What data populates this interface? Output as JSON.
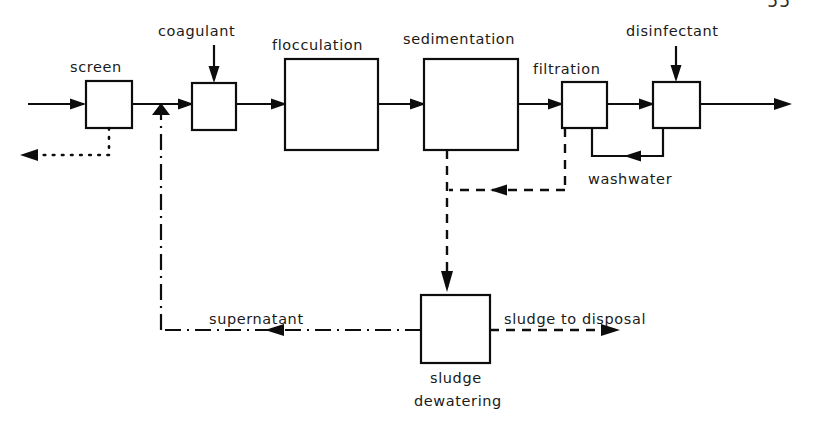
{
  "page": {
    "page_number": "55",
    "width": 813,
    "height": 428
  },
  "diagram": {
    "type": "process-flow-diagram",
    "units": [
      {
        "id": "screen",
        "label": "screen",
        "x": 86,
        "y": 81,
        "w": 46,
        "h": 47
      },
      {
        "id": "coagulant_mixer",
        "label": "",
        "x": 192,
        "y": 83,
        "w": 44,
        "h": 47
      },
      {
        "id": "flocculation",
        "label": "flocculation",
        "x": 285,
        "y": 59,
        "w": 93,
        "h": 91
      },
      {
        "id": "sedimentation",
        "label": "sedimentation",
        "x": 424,
        "y": 59,
        "w": 94,
        "h": 91
      },
      {
        "id": "filtration",
        "label": "filtration",
        "x": 562,
        "y": 82,
        "w": 45,
        "h": 46
      },
      {
        "id": "disinfection",
        "label": "",
        "x": 653,
        "y": 82,
        "w": 47,
        "h": 46
      },
      {
        "id": "sludge_dewatering",
        "label": "sludge dewatering",
        "x": 421,
        "y": 295,
        "w": 69,
        "h": 68
      }
    ],
    "labels": [
      {
        "id": "label-screen",
        "text": "screen",
        "x": 70,
        "y": 72,
        "anchor": "start"
      },
      {
        "id": "label-coagulant",
        "text": "coagulant",
        "x": 158,
        "y": 36,
        "anchor": "start"
      },
      {
        "id": "label-flocculation",
        "text": "flocculation",
        "x": 272,
        "y": 50,
        "anchor": "start"
      },
      {
        "id": "label-sedimentation",
        "text": "sedimentation",
        "x": 403,
        "y": 44,
        "anchor": "start"
      },
      {
        "id": "label-filtration",
        "text": "filtration",
        "x": 533,
        "y": 74,
        "anchor": "start"
      },
      {
        "id": "label-disinfectant",
        "text": "disinfectant",
        "x": 626,
        "y": 36,
        "anchor": "start"
      },
      {
        "id": "label-washwater",
        "text": "washwater",
        "x": 588,
        "y": 184,
        "anchor": "start"
      },
      {
        "id": "label-supernatant",
        "text": "supernatant",
        "x": 209,
        "y": 324,
        "anchor": "start"
      },
      {
        "id": "label-sludge-disposal",
        "text": "sludge  to disposal",
        "x": 504,
        "y": 324,
        "anchor": "start"
      },
      {
        "id": "label-sludge",
        "text": "sludge",
        "x": 430,
        "y": 383,
        "anchor": "start"
      },
      {
        "id": "label-dewatering",
        "text": "dewatering",
        "x": 414,
        "y": 406,
        "anchor": "start"
      }
    ],
    "streams": [
      {
        "id": "influent",
        "style": "solid",
        "label": ""
      },
      {
        "id": "screen-to-mixer",
        "style": "solid",
        "label": ""
      },
      {
        "id": "screenings-reject",
        "style": "dotted",
        "label": ""
      },
      {
        "id": "coagulant-dose",
        "style": "solid",
        "label": "coagulant"
      },
      {
        "id": "mixer-to-flocculation",
        "style": "solid",
        "label": ""
      },
      {
        "id": "floc-to-sedimentation",
        "style": "solid",
        "label": ""
      },
      {
        "id": "sed-to-filtration",
        "style": "solid",
        "label": ""
      },
      {
        "id": "filt-to-disinfection",
        "style": "solid",
        "label": ""
      },
      {
        "id": "disinfectant-dose",
        "style": "solid",
        "label": "disinfectant"
      },
      {
        "id": "effluent",
        "style": "solid",
        "label": ""
      },
      {
        "id": "washwater-return",
        "style": "solid",
        "label": "washwater"
      },
      {
        "id": "sed-sludge",
        "style": "dashed",
        "label": ""
      },
      {
        "id": "filter-backwash-waste",
        "style": "dashed",
        "label": ""
      },
      {
        "id": "sludge-to-disposal",
        "style": "dashed",
        "label": "sludge  to disposal"
      },
      {
        "id": "supernatant-return",
        "style": "dashdot",
        "label": "supernatant"
      }
    ],
    "line_styles": {
      "solid": "process water (solid line)",
      "dashed": "sludge (dashed line)",
      "dashdot": "supernatant recycle (dash-dot line)",
      "dotted": "screenings removal (dotted line)"
    },
    "colors": {
      "ink": "#0d0d0d",
      "paper": "#ffffff"
    }
  }
}
